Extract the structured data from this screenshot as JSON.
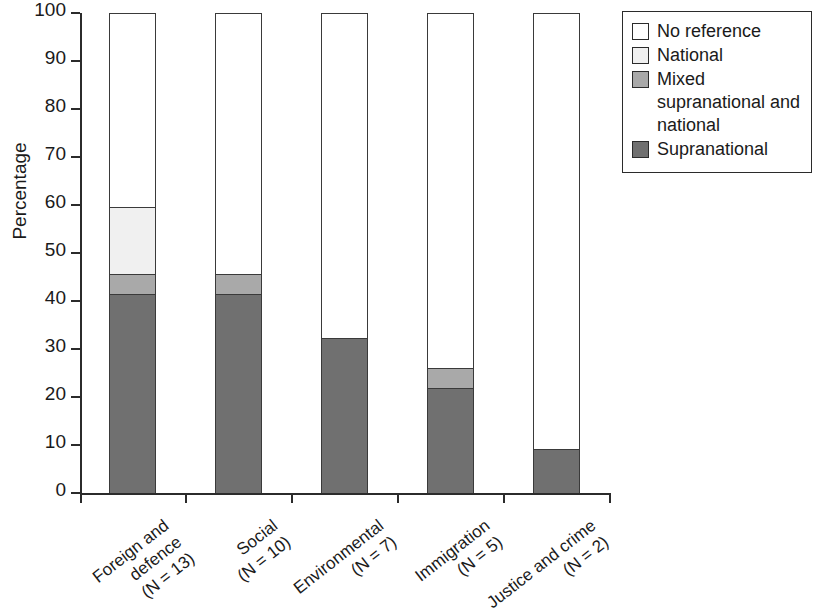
{
  "chart_data": {
    "type": "bar",
    "subtype": "stacked-bar-100-percent",
    "title": "",
    "subtitle": "",
    "xlabel": "",
    "ylabel": "Percentage",
    "ylim": [
      0,
      100
    ],
    "yticks": [
      0,
      10,
      20,
      30,
      40,
      50,
      60,
      70,
      80,
      90,
      100
    ],
    "ytick_labels": [
      "0",
      "10",
      "20",
      "30",
      "40",
      "50",
      "60",
      "70",
      "80",
      "90",
      "100"
    ],
    "grid": false,
    "legend_position": "top-right outside",
    "categories": [
      "Foreign and defence (N = 13)",
      "Social (N = 10)",
      "Environmental (N = 7)",
      "Immigration (N = 5)",
      "Justice and crime (N = 2)"
    ],
    "category_lines": [
      [
        "Foreign and",
        "defence",
        "(N = 13)"
      ],
      [
        "Social",
        "(N = 10)"
      ],
      [
        "Environmental",
        "(N = 7)"
      ],
      [
        "Immigration",
        "(N = 5)"
      ],
      [
        "Justice and crime",
        "(N = 2)"
      ]
    ],
    "category_n": [
      13,
      10,
      7,
      5,
      2
    ],
    "series": [
      {
        "name": "Supranational",
        "color": "#707070",
        "values": [
          41.4,
          41.4,
          32.3,
          21.9,
          9.1
        ]
      },
      {
        "name": "Mixed supranational and national",
        "color": "#a9a9a9",
        "values": [
          4.2,
          4.2,
          0,
          4.2,
          0
        ]
      },
      {
        "name": "National",
        "color": "#f0f0f0",
        "values": [
          14.0,
          0,
          0,
          0,
          0
        ]
      },
      {
        "name": "No reference",
        "color": "#ffffff",
        "values": [
          40.4,
          54.4,
          67.7,
          73.9,
          90.9
        ]
      }
    ],
    "legend_entries": [
      {
        "label": "No reference",
        "color": "#ffffff"
      },
      {
        "label": "National",
        "color": "#f0f0f0"
      },
      {
        "label": "Mixed supranational and national",
        "color": "#a9a9a9"
      },
      {
        "label": "Supranational",
        "color": "#707070"
      }
    ],
    "legend_display_lines": [
      [
        "No reference"
      ],
      [
        "National"
      ],
      [
        "Mixed",
        "supranational and",
        "national"
      ],
      [
        "Supranational"
      ]
    ]
  },
  "axis": {
    "y_label": "Percentage",
    "y_tick_0": "0",
    "y_tick_10": "10",
    "y_tick_20": "20",
    "y_tick_30": "30",
    "y_tick_40": "40",
    "y_tick_50": "50",
    "y_tick_60": "60",
    "y_tick_70": "70",
    "y_tick_80": "80",
    "y_tick_90": "90",
    "y_tick_100": "100"
  },
  "xlabels": {
    "cat0_l1": "Foreign and",
    "cat0_l2": "defence",
    "cat0_l3": "(N = 13)",
    "cat1_l1": "Social",
    "cat1_l2": "(N = 10)",
    "cat2_l1": "Environmental",
    "cat2_l2": "(N = 7)",
    "cat3_l1": "Immigration",
    "cat3_l2": "(N = 5)",
    "cat4_l1": "Justice and crime",
    "cat4_l2": "(N = 2)"
  },
  "legend": {
    "item0": "No reference",
    "item1": "National",
    "item2_l1": "Mixed",
    "item2_l2": "supranational and",
    "item2_l3": "national",
    "item3": "Supranational"
  }
}
